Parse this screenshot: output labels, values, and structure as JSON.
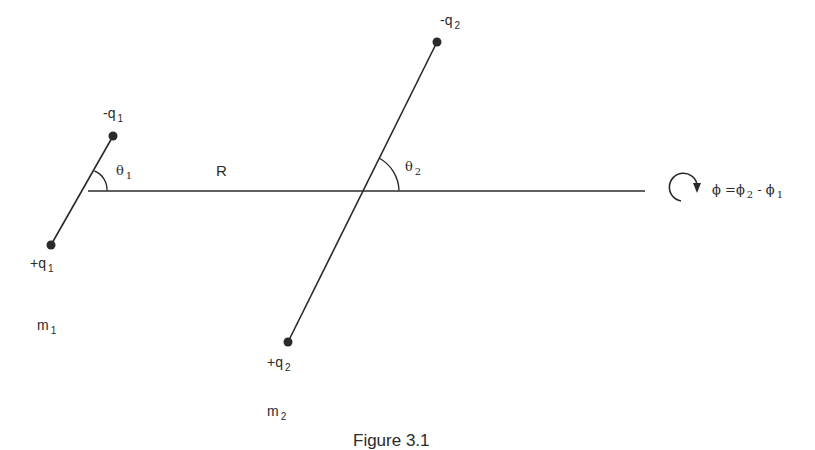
{
  "diagram": {
    "type": "two-dipole geometry",
    "separation_label": "R",
    "dipole1": {
      "negative_charge": {
        "sign": "-",
        "symbol": "q",
        "subscript": "1"
      },
      "positive_charge": {
        "sign": "+",
        "symbol": "q",
        "subscript": "1"
      },
      "angle": {
        "symbol": "θ",
        "subscript": "1"
      },
      "mass": {
        "symbol": "m",
        "subscript": "1"
      }
    },
    "dipole2": {
      "negative_charge": {
        "sign": "-",
        "symbol": "q",
        "subscript": "2"
      },
      "positive_charge": {
        "sign": "+",
        "symbol": "q",
        "subscript": "2"
      },
      "angle": {
        "symbol": "θ",
        "subscript": "2"
      },
      "mass": {
        "symbol": "m",
        "subscript": "2"
      }
    },
    "rotation": {
      "icon": "clockwise-rotation-arrow",
      "equation_lhs": "ϕ",
      "equation_eq": "=",
      "phi2": "ϕ",
      "phi2_sub": "2",
      "minus": "-",
      "phi1": "ϕ",
      "phi1_sub": "1"
    },
    "caption": "Figure 3.1",
    "colors": {
      "ink": "#2a2a2a",
      "background": "#ffffff"
    }
  }
}
